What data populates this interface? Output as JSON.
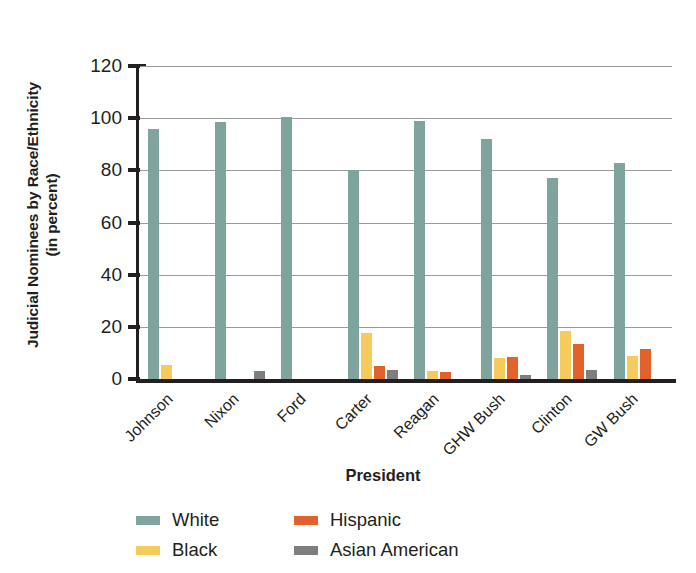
{
  "chart_data": {
    "type": "bar",
    "title": "",
    "xlabel": "President",
    "ylabel": "Judicial Nominees by Race/Ethnicity (in percent)",
    "ylabel_line1": "Judicial Nominees by Race/Ethnicity",
    "ylabel_line2": "(in percent)",
    "ylim": [
      0,
      120
    ],
    "yticks": [
      0,
      20,
      40,
      60,
      80,
      100,
      120
    ],
    "ytick_labels": [
      "0",
      "20",
      "40",
      "60",
      "80",
      "100",
      "120"
    ],
    "grid": true,
    "grid_axis": "y",
    "legend_position": "bottom-left",
    "categories": [
      "Johnson",
      "Nixon",
      "Ford",
      "Carter",
      "Reagan",
      "GHW Bush",
      "Clinton",
      "GW Bush"
    ],
    "series": [
      {
        "name": "White",
        "color": "#7fa49d",
        "values": [
          96.0,
          98.5,
          100.5,
          80.0,
          99.0,
          92.0,
          77.0,
          83.0
        ]
      },
      {
        "name": "Black",
        "color": "#f5cb5c",
        "values": [
          5.5,
          0,
          0,
          17.5,
          3.0,
          8.0,
          18.5,
          9.0
        ]
      },
      {
        "name": "Hispanic",
        "color": "#e2622b",
        "values": [
          0,
          0,
          0,
          5.0,
          2.5,
          8.5,
          13.5,
          11.5
        ]
      },
      {
        "name": "Asian American",
        "color": "#7e7e7e",
        "values": [
          0,
          3.0,
          0,
          3.5,
          0,
          1.5,
          3.5,
          0
        ]
      }
    ]
  },
  "legend": {
    "items": [
      {
        "label": "White",
        "key": "white"
      },
      {
        "label": "Hispanic",
        "key": "hispanic"
      },
      {
        "label": "Black",
        "key": "black"
      },
      {
        "label": "Asian American",
        "key": "asian"
      }
    ]
  }
}
